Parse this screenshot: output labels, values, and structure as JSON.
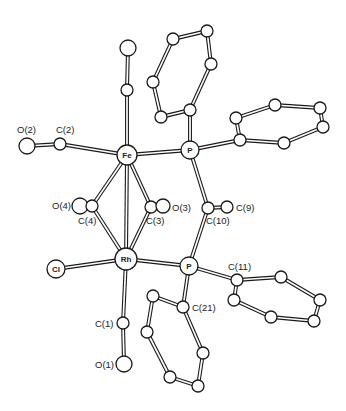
{
  "figure": {
    "type": "ORTEP-style molecular structure",
    "line_color": "#1a1a1a",
    "background": "#ffffff"
  },
  "atoms": [
    {
      "id": "Fe",
      "label": "Fe",
      "x": 127,
      "y": 155,
      "r": 10,
      "label_inside": true
    },
    {
      "id": "P1",
      "label": "P",
      "x": 190,
      "y": 150,
      "r": 9,
      "label_inside": true
    },
    {
      "id": "Rh",
      "label": "Rh",
      "x": 126,
      "y": 259,
      "r": 11,
      "label_inside": true
    },
    {
      "id": "P2",
      "label": "P",
      "x": 189,
      "y": 266,
      "r": 9,
      "label_inside": true
    },
    {
      "id": "Cl",
      "label": "Cl",
      "x": 56,
      "y": 269,
      "r": 9,
      "label_inside": true
    },
    {
      "id": "Ctop",
      "label": "",
      "x": 127,
      "y": 90,
      "r": 6
    },
    {
      "id": "Otop",
      "label": "",
      "x": 128,
      "y": 48,
      "r": 8
    },
    {
      "id": "C2",
      "label": "C(2)",
      "x": 60,
      "y": 144,
      "r": 6,
      "lx": 56,
      "ly": 133
    },
    {
      "id": "O2",
      "label": "O(2)",
      "x": 27,
      "y": 146,
      "r": 8,
      "lx": 17,
      "ly": 133
    },
    {
      "id": "O4",
      "label": "O(4)",
      "x": 80,
      "y": 206,
      "r": 8,
      "lx": 52,
      "ly": 209
    },
    {
      "id": "C4",
      "label": "C(4)",
      "x": 92,
      "y": 206,
      "r": 6,
      "lx": 78,
      "ly": 224
    },
    {
      "id": "C3",
      "label": "C(3)",
      "x": 151,
      "y": 207,
      "r": 6,
      "lx": 146,
      "ly": 224
    },
    {
      "id": "O3",
      "label": "O(3)",
      "x": 163,
      "y": 206,
      "r": 7,
      "lx": 172,
      "ly": 211
    },
    {
      "id": "C10",
      "label": "C(10)",
      "x": 208,
      "y": 208,
      "r": 6,
      "lx": 206,
      "ly": 224
    },
    {
      "id": "C9",
      "label": "C(9)",
      "x": 227,
      "y": 207,
      "r": 6,
      "lx": 236,
      "ly": 211
    },
    {
      "id": "C11",
      "label": "C(11)",
      "x": 237,
      "y": 280,
      "r": 6,
      "lx": 228,
      "ly": 270
    },
    {
      "id": "C21",
      "label": "C(21)",
      "x": 183,
      "y": 307,
      "r": 6,
      "lx": 192,
      "ly": 311
    },
    {
      "id": "C1",
      "label": "C(1)",
      "x": 123,
      "y": 323,
      "r": 6,
      "lx": 95,
      "ly": 327
    },
    {
      "id": "O1",
      "label": "O(1)",
      "x": 124,
      "y": 364,
      "r": 8,
      "lx": 95,
      "ly": 368
    },
    {
      "id": "A1",
      "label": "",
      "x": 190,
      "y": 110,
      "r": 6
    },
    {
      "id": "A2",
      "label": "",
      "x": 161,
      "y": 117,
      "r": 6
    },
    {
      "id": "A3",
      "label": "",
      "x": 153,
      "y": 82,
      "r": 6
    },
    {
      "id": "A4",
      "label": "",
      "x": 173,
      "y": 39,
      "r": 6
    },
    {
      "id": "A5",
      "label": "",
      "x": 207,
      "y": 31,
      "r": 6
    },
    {
      "id": "A6",
      "label": "",
      "x": 211,
      "y": 64,
      "r": 6
    },
    {
      "id": "B1",
      "label": "",
      "x": 240,
      "y": 140,
      "r": 6
    },
    {
      "id": "B2",
      "label": "",
      "x": 236,
      "y": 118,
      "r": 6
    },
    {
      "id": "B3",
      "label": "",
      "x": 275,
      "y": 105,
      "r": 6
    },
    {
      "id": "B4",
      "label": "",
      "x": 320,
      "y": 108,
      "r": 6
    },
    {
      "id": "B5",
      "label": "",
      "x": 323,
      "y": 127,
      "r": 6
    },
    {
      "id": "B6",
      "label": "",
      "x": 284,
      "y": 143,
      "r": 6
    },
    {
      "id": "D2",
      "label": "",
      "x": 281,
      "y": 277,
      "r": 6
    },
    {
      "id": "D3",
      "label": "",
      "x": 320,
      "y": 300,
      "r": 6
    },
    {
      "id": "D4",
      "label": "",
      "x": 314,
      "y": 321,
      "r": 6
    },
    {
      "id": "D5",
      "label": "",
      "x": 271,
      "y": 317,
      "r": 6
    },
    {
      "id": "D6",
      "label": "",
      "x": 234,
      "y": 300,
      "r": 6
    },
    {
      "id": "E2",
      "label": "",
      "x": 153,
      "y": 296,
      "r": 6
    },
    {
      "id": "E3",
      "label": "",
      "x": 147,
      "y": 332,
      "r": 6
    },
    {
      "id": "E4",
      "label": "",
      "x": 170,
      "y": 377,
      "r": 6
    },
    {
      "id": "E5",
      "label": "",
      "x": 198,
      "y": 386,
      "r": 6
    },
    {
      "id": "E6",
      "label": "",
      "x": 203,
      "y": 353,
      "r": 6
    }
  ],
  "bonds": [
    [
      "Fe",
      "Ctop"
    ],
    [
      "Ctop",
      "Otop"
    ],
    [
      "Fe",
      "C2"
    ],
    [
      "C2",
      "O2"
    ],
    [
      "Fe",
      "P1"
    ],
    [
      "Fe",
      "C4"
    ],
    [
      "C4",
      "O4"
    ],
    [
      "Fe",
      "C3"
    ],
    [
      "C3",
      "O3"
    ],
    [
      "Fe",
      "Rh"
    ],
    [
      "Rh",
      "C4"
    ],
    [
      "Rh",
      "C3"
    ],
    [
      "Rh",
      "Cl"
    ],
    [
      "Rh",
      "P2"
    ],
    [
      "Rh",
      "C1"
    ],
    [
      "C1",
      "O1"
    ],
    [
      "P1",
      "A1"
    ],
    [
      "A1",
      "A2"
    ],
    [
      "A2",
      "A3"
    ],
    [
      "A3",
      "A4"
    ],
    [
      "A4",
      "A5"
    ],
    [
      "A5",
      "A6"
    ],
    [
      "A6",
      "A1"
    ],
    [
      "P1",
      "B1"
    ],
    [
      "B1",
      "B2"
    ],
    [
      "B2",
      "B3"
    ],
    [
      "B3",
      "B4"
    ],
    [
      "B4",
      "B5"
    ],
    [
      "B5",
      "B6"
    ],
    [
      "B6",
      "B1"
    ],
    [
      "P1",
      "C10"
    ],
    [
      "C10",
      "C9"
    ],
    [
      "C10",
      "P2"
    ],
    [
      "P2",
      "C11"
    ],
    [
      "C11",
      "D2"
    ],
    [
      "D2",
      "D3"
    ],
    [
      "D3",
      "D4"
    ],
    [
      "D4",
      "D5"
    ],
    [
      "D5",
      "D6"
    ],
    [
      "D6",
      "C11"
    ],
    [
      "P2",
      "C21"
    ],
    [
      "C21",
      "E2"
    ],
    [
      "E2",
      "E3"
    ],
    [
      "E3",
      "E4"
    ],
    [
      "E4",
      "E5"
    ],
    [
      "E5",
      "E6"
    ],
    [
      "E6",
      "C21"
    ]
  ],
  "caption": {
    "text": "",
    "note": "caption text at bottom edge is cut off and illegible"
  }
}
